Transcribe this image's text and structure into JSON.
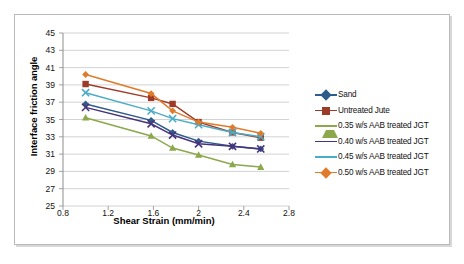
{
  "chart_data": {
    "type": "line",
    "title": "",
    "xlabel": "Shear Strain (mm/min)",
    "ylabel": "Interface friction angle",
    "xlim": [
      0.8,
      2.8
    ],
    "ylim": [
      25,
      45
    ],
    "xticks": [
      "0.8",
      "1.2",
      "1.6",
      "2",
      "2.4",
      "2.8"
    ],
    "yticks": [
      "25",
      "27",
      "29",
      "31",
      "33",
      "35",
      "37",
      "39",
      "41",
      "43",
      "45"
    ],
    "grid": "horizontal",
    "legend_position": "right",
    "x": [
      1.0,
      1.58,
      1.77,
      2.0,
      2.3,
      2.55
    ],
    "series": [
      {
        "name": "Sand",
        "color": "#2E5C8A",
        "marker": "diamond",
        "values": [
          36.8,
          34.9,
          33.5,
          32.5,
          31.9,
          31.6
        ]
      },
      {
        "name": "Untreated Jute",
        "color": "#9E3B28",
        "marker": "square",
        "values": [
          39.1,
          37.5,
          36.8,
          34.7,
          33.5,
          32.9
        ]
      },
      {
        "name": "0.35 w/s AAB treated JGT",
        "color": "#8BA84B",
        "marker": "triangle",
        "values": [
          35.2,
          33.1,
          31.7,
          30.9,
          29.8,
          29.5
        ]
      },
      {
        "name": "0.40 w/s AAB treated JGT",
        "color": "#45347B",
        "marker": "x",
        "values": [
          36.4,
          34.5,
          33.2,
          32.2,
          31.9,
          31.6
        ]
      },
      {
        "name": "0.45 w/s AAB treated JGT",
        "color": "#4BACC6",
        "marker": "x",
        "values": [
          38.1,
          36.0,
          35.1,
          34.4,
          33.5,
          33.0
        ]
      },
      {
        "name": "0.50 w/s AAB treated JGT",
        "color": "#E07B2C",
        "marker": "diamond",
        "values": [
          40.2,
          38.0,
          36.0,
          34.7,
          34.1,
          33.4
        ]
      }
    ]
  }
}
